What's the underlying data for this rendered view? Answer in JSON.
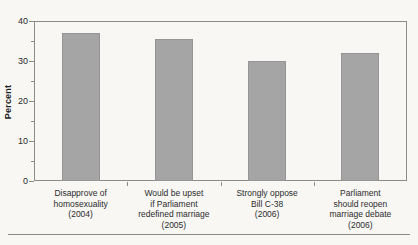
{
  "chart_data": {
    "type": "bar",
    "title": "",
    "xlabel": "",
    "ylabel": "Percent",
    "ylim": [
      0,
      40
    ],
    "y_ticks": [
      0,
      10,
      20,
      30,
      40
    ],
    "y_minor_ticks": [
      5,
      15,
      25,
      35
    ],
    "grid": false,
    "legend": false,
    "categories": [
      [
        "Disapprove of",
        "homosexuality",
        "(2004)"
      ],
      [
        "Would be upset",
        "if Parliament",
        "redefined marriage",
        "(2005)"
      ],
      [
        "Strongly oppose",
        "Bill C-38",
        "(2006)"
      ],
      [
        "Parliament",
        "should reopen",
        "marriage debate",
        "(2006)"
      ]
    ],
    "values": [
      37,
      35.5,
      30,
      32
    ],
    "colors": {
      "bar_fill": "#a5a5a5",
      "bar_edge": "#959595",
      "frame": "#8b8b8b",
      "text": "#2b2b2b",
      "background": "#f8f7f4"
    }
  }
}
